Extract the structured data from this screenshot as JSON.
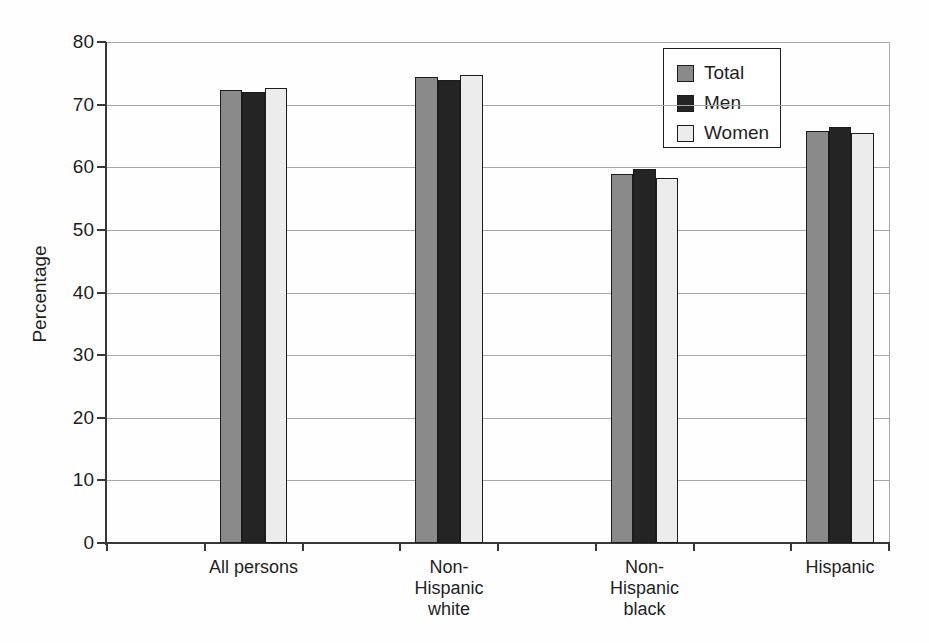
{
  "chart_data": {
    "type": "bar",
    "title": "",
    "xlabel": "",
    "ylabel": "Percentage",
    "categories": [
      "All persons",
      "Non-Hispanic white",
      "Non-Hispanic black",
      "Hispanic"
    ],
    "category_label_lines": [
      [
        "All persons"
      ],
      [
        "Non-",
        "Hispanic",
        "white"
      ],
      [
        "Non-",
        "Hispanic",
        "black"
      ],
      [
        "Hispanic"
      ]
    ],
    "series": [
      {
        "name": "Total",
        "color": "#8a8a8a",
        "values": [
          72.3,
          74.4,
          58.9,
          65.8
        ]
      },
      {
        "name": "Men",
        "color": "#242424",
        "values": [
          72.0,
          73.9,
          59.8,
          66.4
        ]
      },
      {
        "name": "Women",
        "color": "#ececec",
        "values": [
          72.6,
          74.7,
          58.3,
          65.5
        ]
      }
    ],
    "ylim": [
      0,
      80
    ],
    "ytick_interval": 10,
    "ytick_labels": [
      "0",
      "10",
      "20",
      "30",
      "40",
      "50",
      "60",
      "70",
      "80"
    ],
    "grid": true,
    "legend_position": "top-right"
  },
  "style": {
    "background": "#fefefe",
    "gridline_color": "#a8a8a8",
    "axis_color": "#383838",
    "bar_outline_color": "#1c1c1c",
    "legend_border_color": "#1f1f1f",
    "text_color": "#1f1f1f"
  }
}
